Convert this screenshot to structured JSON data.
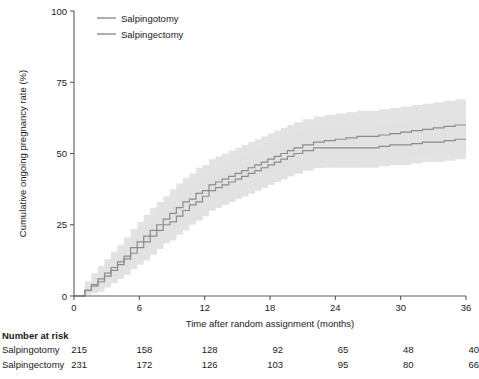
{
  "chart_data": {
    "type": "line",
    "title": "",
    "xlabel": "Time after random assignment (months)",
    "ylabel": "Cumulative ongoing pregnancy rate (%)",
    "xlim": [
      0,
      36
    ],
    "ylim": [
      0,
      100
    ],
    "xticks": [
      0,
      6,
      12,
      18,
      24,
      30,
      36
    ],
    "yticks": [
      0,
      25,
      50,
      75,
      100
    ],
    "grid": false,
    "legend_position": "top-left",
    "series": [
      {
        "name": "Salpingotomy",
        "color": "#8c8c8c",
        "x": [
          0,
          1,
          1.6,
          2.2,
          2.8,
          3.4,
          4,
          4.6,
          5.2,
          5.8,
          6.4,
          7,
          7.6,
          8.2,
          8.8,
          9.4,
          10,
          10.6,
          11.2,
          11.8,
          12.4,
          13,
          13.6,
          14.2,
          14.8,
          15.4,
          16,
          16.6,
          17.2,
          17.8,
          18.4,
          19,
          19.6,
          20.2,
          21,
          22,
          23,
          24,
          25,
          26,
          27,
          28,
          29,
          30,
          31,
          32,
          33,
          34,
          35,
          36
        ],
        "y": [
          0,
          2,
          4,
          6,
          8,
          10,
          12,
          14,
          17,
          19,
          21,
          23,
          25,
          27,
          29,
          31,
          33,
          34,
          36,
          37,
          39,
          40,
          41,
          42,
          43,
          44,
          45,
          46,
          47,
          48,
          49,
          50,
          51,
          52,
          53,
          54,
          54.5,
          55,
          55.5,
          56,
          56,
          56.5,
          57,
          57.5,
          58,
          58.5,
          59,
          59.5,
          60,
          60
        ]
      },
      {
        "name": "Salpingectomy",
        "color": "#8c8c8c",
        "x": [
          0,
          1,
          1.6,
          2.2,
          2.8,
          3.4,
          4,
          4.6,
          5.2,
          5.8,
          6.4,
          7,
          7.6,
          8.2,
          8.8,
          9.4,
          10,
          10.6,
          11.2,
          11.8,
          12.4,
          13,
          13.6,
          14.2,
          14.8,
          15.4,
          16,
          16.6,
          17.2,
          17.8,
          18.4,
          19,
          19.6,
          20.2,
          21,
          22,
          23,
          24,
          25,
          26,
          27,
          28,
          29,
          30,
          31,
          32,
          33,
          34,
          35,
          36
        ],
        "y": [
          0,
          2,
          3.5,
          5,
          7,
          9,
          11,
          13,
          15,
          17,
          19,
          21,
          23,
          25,
          26,
          28,
          30,
          32,
          33,
          35,
          37,
          38,
          39,
          40,
          41,
          42,
          43,
          44,
          45,
          46,
          47,
          48,
          49,
          50,
          51,
          52,
          52,
          52,
          52,
          52,
          52,
          52.5,
          53,
          53,
          53.5,
          54,
          54,
          54.5,
          55,
          55
        ]
      }
    ],
    "confidence_bands": [
      {
        "series": "Salpingotomy",
        "upper": [
          0,
          5,
          8,
          10.5,
          13,
          15.5,
          18,
          20.5,
          23.5,
          26,
          28.5,
          31,
          33,
          35,
          37.5,
          39.5,
          41.5,
          43,
          45,
          46,
          48,
          49,
          50,
          51,
          52,
          53,
          54,
          55,
          56,
          57,
          58,
          59,
          60,
          61,
          62,
          63,
          63.5,
          64,
          64.5,
          65,
          65,
          65.5,
          66,
          66.5,
          67,
          67.5,
          68,
          68.5,
          69,
          69
        ],
        "lower": [
          0,
          0.5,
          1.5,
          2.5,
          3.5,
          5,
          6.5,
          8,
          10.5,
          12,
          13.5,
          15,
          17,
          19,
          20.5,
          22.5,
          24.5,
          25.5,
          27,
          28.5,
          30,
          31,
          32,
          33,
          34,
          35,
          36,
          37,
          38,
          39,
          40,
          41,
          42,
          43,
          44,
          45,
          45.5,
          46,
          46.5,
          47,
          47,
          47.5,
          48,
          48.5,
          49,
          49.5,
          50,
          50.5,
          51,
          51
        ]
      },
      {
        "series": "Salpingectomy",
        "upper": [
          0,
          5,
          7,
          9,
          11.5,
          14,
          16.5,
          19,
          21,
          23.5,
          26,
          28,
          30,
          32,
          33.5,
          35.5,
          37.5,
          39.5,
          40.5,
          42.5,
          44.5,
          45.5,
          46.5,
          47.5,
          48.5,
          49.5,
          50.5,
          51.5,
          52.5,
          53.5,
          54.5,
          55.5,
          56.5,
          57.5,
          58.5,
          59.5,
          59.5,
          59.5,
          59.5,
          59.5,
          59.5,
          60,
          60.5,
          60.5,
          61,
          61.5,
          61.5,
          62,
          62.5,
          62.5
        ],
        "lower": [
          0,
          0.5,
          1,
          1.5,
          3,
          4.5,
          6,
          7.5,
          9.5,
          11,
          12.5,
          14.5,
          16.5,
          18.5,
          19.5,
          21.5,
          23,
          25,
          26.5,
          28,
          30,
          31,
          32,
          33,
          34,
          35,
          36,
          37,
          38,
          39,
          40,
          41,
          42,
          43,
          44,
          45,
          45,
          45,
          45,
          45,
          45,
          45.5,
          46,
          46,
          46.5,
          47,
          47,
          47.5,
          48,
          48
        ]
      }
    ]
  },
  "legend": {
    "items": [
      {
        "label": "Salpingotomy"
      },
      {
        "label": "Salpingectomy"
      }
    ]
  },
  "risk_table": {
    "title": "Number at risk",
    "rows": [
      {
        "label": "Salpingotomy",
        "values": [
          "215",
          "158",
          "128",
          "92",
          "65",
          "48",
          "40"
        ]
      },
      {
        "label": "Salpingectomy",
        "values": [
          "231",
          "172",
          "126",
          "103",
          "95",
          "80",
          "66"
        ]
      }
    ]
  }
}
